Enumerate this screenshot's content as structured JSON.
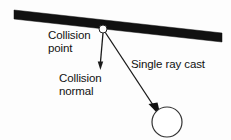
{
  "figure": {
    "background_color": "#fdfdfd",
    "width": 231,
    "height": 140
  },
  "labels": {
    "collision_point": {
      "line1": "Collision",
      "line2": "point"
    },
    "collision_normal": {
      "line1": "Collision",
      "line2": "normal"
    },
    "single_ray_cast": {
      "line1": "Single ray cast"
    }
  },
  "colors": {
    "surface_bar": "#111111",
    "line": "#1a1a1a",
    "text": "#111111",
    "circle_fill": "#ffffff",
    "circle_stroke": "#333333",
    "collision_point_fill": "#ffffff",
    "collision_point_stroke": "#222222"
  },
  "geometry": {
    "surface_bar": {
      "left_x": 14,
      "left_y": 14,
      "right_x": 222,
      "right_y": 38,
      "thickness": 9
    },
    "collision_point": {
      "x": 103,
      "y": 29,
      "radius": 4
    },
    "collision_normal_arrow": {
      "from_x": 103,
      "from_y": 33,
      "to_x": 100,
      "to_y": 70
    },
    "ray_cast_arrow": {
      "from_x": 104,
      "from_y": 32,
      "to_x": 160,
      "to_y": 115
    },
    "object_circle": {
      "cx": 167,
      "cy": 122,
      "r": 15
    }
  }
}
